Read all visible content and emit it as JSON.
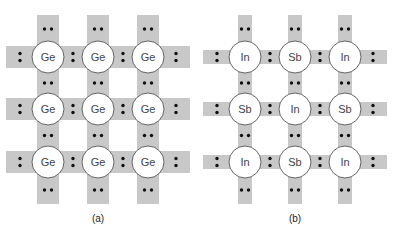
{
  "diagram": {
    "colors": {
      "bond": "#c8c8c8",
      "atom_fill": "#ffffff",
      "atom_stroke": "#555555",
      "electron": "#111111",
      "text": "#444444"
    },
    "panels": [
      {
        "label": "(a)",
        "rows": [
          [
            "Ge",
            "Ge",
            "Ge"
          ],
          [
            "Ge",
            "Ge",
            "Ge"
          ],
          [
            "Ge",
            "Ge",
            "Ge"
          ]
        ]
      },
      {
        "label": "(b)",
        "rows": [
          [
            "In",
            "Sb",
            "In"
          ],
          [
            "Sb",
            "In",
            "Sb"
          ],
          [
            "In",
            "Sb",
            "In"
          ]
        ]
      }
    ]
  }
}
